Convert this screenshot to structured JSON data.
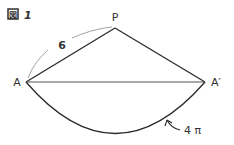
{
  "figure": {
    "title_icon": "図",
    "title_number": "1",
    "points": {
      "P": {
        "label": "P",
        "x": 115,
        "y": 28
      },
      "A": {
        "label": "A",
        "x": 26,
        "y": 82
      },
      "A_prime": {
        "label": "A′",
        "x": 205,
        "y": 82
      }
    },
    "side_length_label": "6",
    "arc_length_label": "4 π",
    "colors": {
      "line": "#2a2a2a",
      "thin_arc": "#9a9a9a",
      "text": "#333333"
    }
  }
}
